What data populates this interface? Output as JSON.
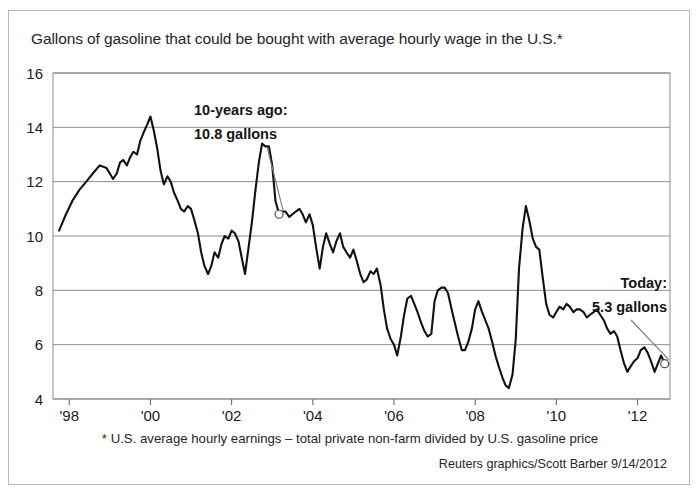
{
  "chart_data": {
    "type": "line",
    "title": "Gallons of gasoline that could be bought with average hourly wage in the U.S.*",
    "xlabel": "",
    "ylabel": "",
    "ylim": [
      4,
      16
    ],
    "xlim": [
      1997.6,
      2012.8
    ],
    "yticks": [
      4,
      6,
      8,
      10,
      12,
      14,
      16
    ],
    "ytick_labels": [
      "4",
      "6",
      "8",
      "10",
      "12",
      "14",
      "16"
    ],
    "xticks": [
      1998,
      2000,
      2002,
      2004,
      2006,
      2008,
      2010,
      2012
    ],
    "xtick_labels": [
      "'98",
      "'00",
      "'02",
      "'04",
      "'06",
      "'08",
      "'10",
      "'12"
    ],
    "grid": "horizontal",
    "legend": "none",
    "series": [
      {
        "name": "Gallons per average hourly wage",
        "color": "#111111",
        "x": [
          1997.75,
          1997.92,
          1998.08,
          1998.25,
          1998.42,
          1998.58,
          1998.75,
          1998.92,
          1999.08,
          1999.17,
          1999.25,
          1999.33,
          1999.42,
          1999.5,
          1999.58,
          1999.67,
          1999.75,
          1999.83,
          1999.92,
          2000.0,
          2000.08,
          2000.17,
          2000.25,
          2000.33,
          2000.42,
          2000.5,
          2000.58,
          2000.67,
          2000.75,
          2000.83,
          2000.92,
          2001.0,
          2001.08,
          2001.17,
          2001.25,
          2001.33,
          2001.42,
          2001.5,
          2001.58,
          2001.67,
          2001.75,
          2001.83,
          2001.92,
          2002.0,
          2002.08,
          2002.17,
          2002.25,
          2002.33,
          2002.42,
          2002.5,
          2002.58,
          2002.67,
          2002.75,
          2002.83,
          2002.92,
          2003.0,
          2003.08,
          2003.17,
          2003.25,
          2003.33,
          2003.42,
          2003.5,
          2003.58,
          2003.67,
          2003.75,
          2003.83,
          2003.92,
          2004.0,
          2004.08,
          2004.17,
          2004.25,
          2004.33,
          2004.42,
          2004.5,
          2004.58,
          2004.67,
          2004.75,
          2004.83,
          2004.92,
          2005.0,
          2005.08,
          2005.17,
          2005.25,
          2005.33,
          2005.42,
          2005.5,
          2005.58,
          2005.67,
          2005.75,
          2005.83,
          2005.92,
          2006.0,
          2006.08,
          2006.17,
          2006.25,
          2006.33,
          2006.42,
          2006.5,
          2006.58,
          2006.67,
          2006.75,
          2006.83,
          2006.92,
          2007.0,
          2007.08,
          2007.17,
          2007.25,
          2007.33,
          2007.42,
          2007.5,
          2007.58,
          2007.67,
          2007.75,
          2007.83,
          2007.92,
          2008.0,
          2008.08,
          2008.17,
          2008.25,
          2008.33,
          2008.42,
          2008.5,
          2008.58,
          2008.67,
          2008.75,
          2008.83,
          2008.92,
          2009.0,
          2009.08,
          2009.17,
          2009.25,
          2009.33,
          2009.42,
          2009.5,
          2009.58,
          2009.67,
          2009.75,
          2009.83,
          2009.92,
          2010.0,
          2010.08,
          2010.17,
          2010.25,
          2010.33,
          2010.42,
          2010.5,
          2010.58,
          2010.67,
          2010.75,
          2010.83,
          2010.92,
          2011.0,
          2011.08,
          2011.17,
          2011.25,
          2011.33,
          2011.42,
          2011.5,
          2011.58,
          2011.67,
          2011.75,
          2011.83,
          2011.92,
          2012.0,
          2012.08,
          2012.17,
          2012.25,
          2012.33,
          2012.42,
          2012.5,
          2012.58,
          2012.67
        ],
        "y": [
          10.2,
          10.8,
          11.3,
          11.7,
          12.0,
          12.3,
          12.6,
          12.5,
          12.1,
          12.3,
          12.7,
          12.8,
          12.6,
          12.9,
          13.1,
          13.0,
          13.5,
          13.8,
          14.1,
          14.4,
          13.9,
          13.2,
          12.4,
          11.9,
          12.2,
          12.0,
          11.6,
          11.3,
          11.0,
          10.9,
          11.1,
          11.0,
          10.6,
          10.1,
          9.4,
          8.9,
          8.6,
          8.9,
          9.4,
          9.2,
          9.7,
          10.0,
          9.9,
          10.2,
          10.1,
          9.8,
          9.2,
          8.6,
          9.6,
          10.5,
          11.6,
          12.7,
          13.4,
          13.3,
          13.3,
          12.6,
          11.3,
          10.8,
          10.9,
          10.9,
          10.7,
          10.8,
          10.9,
          11.0,
          10.8,
          10.5,
          10.8,
          10.4,
          9.6,
          8.8,
          9.6,
          10.1,
          9.7,
          9.4,
          9.8,
          10.1,
          9.6,
          9.4,
          9.2,
          9.5,
          9.1,
          8.6,
          8.3,
          8.4,
          8.7,
          8.6,
          8.8,
          8.2,
          7.3,
          6.6,
          6.2,
          6.0,
          5.6,
          6.3,
          7.1,
          7.7,
          7.8,
          7.5,
          7.2,
          6.8,
          6.5,
          6.3,
          6.4,
          7.6,
          8.0,
          8.1,
          8.1,
          7.9,
          7.3,
          6.8,
          6.3,
          5.8,
          5.8,
          6.1,
          6.6,
          7.3,
          7.6,
          7.2,
          6.9,
          6.6,
          6.1,
          5.6,
          5.2,
          4.8,
          4.5,
          4.4,
          4.9,
          6.2,
          8.8,
          10.3,
          11.1,
          10.6,
          9.9,
          9.6,
          9.5,
          8.4,
          7.5,
          7.1,
          7.0,
          7.2,
          7.4,
          7.3,
          7.5,
          7.4,
          7.2,
          7.3,
          7.3,
          7.2,
          7.0,
          7.1,
          7.2,
          7.3,
          7.1,
          6.9,
          6.6,
          6.4,
          6.5,
          6.3,
          5.8,
          5.3,
          5.0,
          5.2,
          5.4,
          5.5,
          5.8,
          5.9,
          5.7,
          5.4,
          5.0,
          5.3,
          5.6,
          5.3
        ]
      }
    ],
    "annotations": [
      {
        "id": "ten-years-ago",
        "line1": "10-years ago:",
        "line2": "10.8 gallons",
        "point_x": 2003.17,
        "point_y": 10.8,
        "value": 10.8
      },
      {
        "id": "today",
        "line1": "Today:",
        "line2": "5.3 gallons",
        "point_x": 2012.67,
        "point_y": 5.3,
        "value": 5.3
      }
    ],
    "footnote": "* U.S. average hourly earnings – total private non-farm divided by U.S. gasoline price",
    "credit": "Reuters graphics/Scott Barber 9/14/2012"
  }
}
